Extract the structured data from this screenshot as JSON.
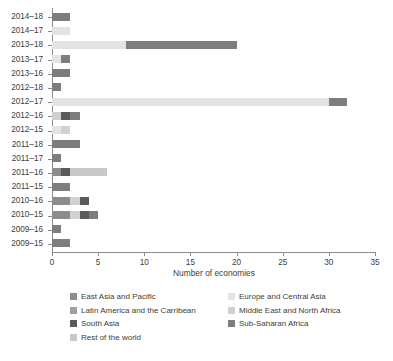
{
  "chart_data": {
    "type": "bar",
    "orientation": "horizontal",
    "stacked": true,
    "title": "",
    "xlabel": "Number of economies",
    "ylabel": "",
    "xlim": [
      0,
      35
    ],
    "xticks": [
      0,
      5,
      10,
      15,
      20,
      25,
      30,
      35
    ],
    "grid": false,
    "legend_position": "bottom",
    "categories": [
      "2014–18",
      "2014–17",
      "2013–18",
      "2013–17",
      "2013–16",
      "2012–18",
      "2012–17",
      "2012–16",
      "2012–15",
      "2011–18",
      "2011–17",
      "2011–16",
      "2011–15",
      "2010–16",
      "2010–15",
      "2009–16",
      "2009–15"
    ],
    "series": [
      {
        "name": "East Asia and Pacific",
        "color": "#8c8c8c",
        "values": [
          0,
          0,
          0,
          0,
          0,
          0,
          0,
          0,
          0,
          0,
          0,
          1,
          0,
          2,
          2,
          0,
          0
        ]
      },
      {
        "name": "Europe and Central Asia",
        "color": "#e3e3e3",
        "values": [
          0,
          2,
          8,
          1,
          0,
          0,
          30,
          0,
          1,
          0,
          0,
          0,
          0,
          0,
          0,
          0,
          0
        ]
      },
      {
        "name": "Latin America and the Carribean",
        "color": "#9e9e9e",
        "values": [
          0,
          0,
          0,
          0,
          0,
          0,
          0,
          0,
          0,
          0,
          0,
          0,
          0,
          0,
          0,
          0,
          0
        ]
      },
      {
        "name": "Middle East and North Africa",
        "color": "#d0d0d0",
        "values": [
          0,
          0,
          0,
          0,
          0,
          0,
          0,
          1,
          1,
          0,
          0,
          0,
          0,
          1,
          1,
          0,
          0
        ]
      },
      {
        "name": "South Asia",
        "color": "#5a5a5a",
        "values": [
          0,
          0,
          0,
          0,
          0,
          0,
          0,
          1,
          0,
          0,
          0,
          1,
          0,
          1,
          1,
          0,
          0
        ]
      },
      {
        "name": "Sub-Saharan Africa",
        "color": "#7d7d7d",
        "values": [
          2,
          0,
          12,
          1,
          2,
          1,
          2,
          1,
          0,
          3,
          1,
          0,
          2,
          0,
          1,
          1,
          2
        ]
      },
      {
        "name": "Rest of the world",
        "color": "#c8c8c8",
        "values": [
          0,
          0,
          0,
          0,
          0,
          0,
          0,
          0,
          0,
          0,
          0,
          4,
          0,
          0,
          0,
          0,
          0
        ]
      }
    ],
    "totals": [
      2,
      2,
      20,
      2,
      2,
      1,
      32,
      3,
      2,
      3,
      1,
      6,
      2,
      4,
      5,
      1,
      2
    ]
  },
  "axis": {
    "x_title": "Number of economies",
    "x_tick_labels": [
      "0",
      "5",
      "10",
      "15",
      "20",
      "25",
      "30",
      "35"
    ],
    "y_tick_labels": [
      "2014–18",
      "2014–17",
      "2013–18",
      "2013–17",
      "2013–16",
      "2012–18",
      "2012–17",
      "2012–16",
      "2012–15",
      "2011–18",
      "2011–17",
      "2011–16",
      "2011–15",
      "2010–16",
      "2010–15",
      "2009–16",
      "2009–15"
    ]
  },
  "legend": {
    "column_left": [
      {
        "label": "East Asia and Pacific",
        "color": "#8c8c8c"
      },
      {
        "label": "Latin America and the Carribean",
        "color": "#9e9e9e"
      },
      {
        "label": "South Asia",
        "color": "#5a5a5a"
      },
      {
        "label": "Rest of the world",
        "color": "#c8c8c8"
      }
    ],
    "column_right": [
      {
        "label": "Europe and Central Asia",
        "color": "#e3e3e3"
      },
      {
        "label": "Middle East and North Africa",
        "color": "#d0d0d0"
      },
      {
        "label": "Sub-Saharan Africa",
        "color": "#7d7d7d"
      }
    ]
  }
}
